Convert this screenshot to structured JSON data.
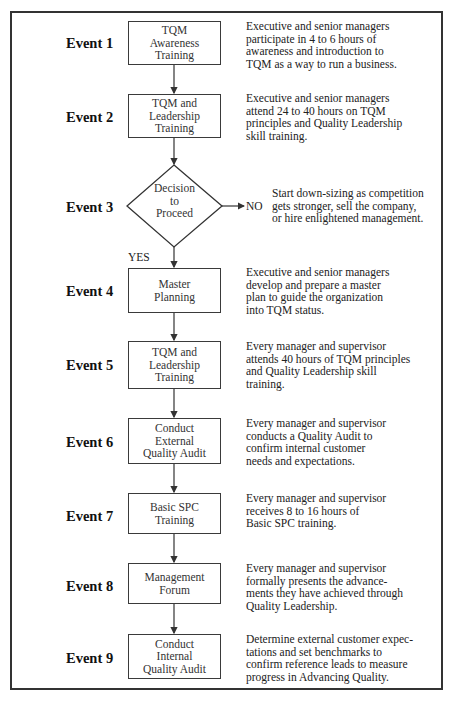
{
  "events": [
    {
      "label": "Event 1",
      "box": [
        "TQM",
        "Awareness",
        "Training"
      ],
      "desc": [
        "Executive and senior managers",
        "participate in 4 to 6 hours of",
        "awareness and introduction to",
        "TQM as a way to run a business."
      ]
    },
    {
      "label": "Event 2",
      "box": [
        "TQM and",
        "Leadership",
        "Training"
      ],
      "desc": [
        "Executive and senior managers",
        "attend 24 to 40 hours on TQM",
        "principles and Quality Leadership",
        "skill training."
      ]
    },
    {
      "label": "Event 3",
      "box": [
        "Decision",
        "to",
        "Proceed"
      ],
      "desc": [
        "Start down-sizing as competition",
        "gets stronger, sell the company,",
        "or hire enlightened management."
      ]
    },
    {
      "label": "Event 4",
      "box": [
        "Master",
        "Planning"
      ],
      "desc": [
        "Executive and senior managers",
        "develop and prepare a master",
        "plan to guide the organization",
        "into TQM status."
      ]
    },
    {
      "label": "Event 5",
      "box": [
        "TQM and",
        "Leadership",
        "Training"
      ],
      "desc": [
        "Every manager and supervisor",
        "attends 40 hours of TQM principles",
        "and Quality Leadership skill",
        "training."
      ]
    },
    {
      "label": "Event 6",
      "box": [
        "Conduct",
        "External",
        "Quality Audit"
      ],
      "desc": [
        "Every manager and supervisor",
        "conducts a Quality Audit to",
        "confirm internal customer",
        "needs and expectations."
      ]
    },
    {
      "label": "Event 7",
      "box": [
        "Basic SPC",
        "Training"
      ],
      "desc": [
        "Every manager and supervisor",
        "receives 8 to 16 hours of",
        "Basic SPC training."
      ]
    },
    {
      "label": "Event 8",
      "box": [
        "Management",
        "Forum"
      ],
      "desc": [
        "Every manager and supervisor",
        "formally presents the advance-",
        "ments they have achieved through",
        "Quality Leadership."
      ]
    },
    {
      "label": "Event 9",
      "box": [
        "Conduct",
        "Internal",
        "Quality Audit"
      ],
      "desc": [
        "Determine external customer expec-",
        "tations and set benchmarks to",
        "confirm reference leads to measure",
        "progress in Advancing Quality."
      ]
    }
  ],
  "decision": {
    "no_label": "NO",
    "yes_label": "YES"
  }
}
